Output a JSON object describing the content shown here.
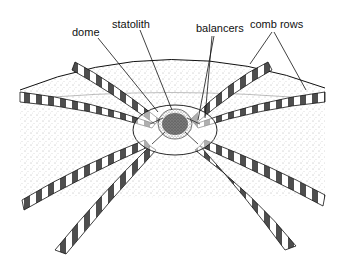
{
  "figure": {
    "labels": {
      "dome": "dome",
      "statolith": "statolith",
      "balancers": "balancers",
      "comb_rows": "comb rows"
    }
  },
  "colors": {
    "ink": "#111111",
    "background": "#ffffff",
    "stipple": "#555555"
  }
}
